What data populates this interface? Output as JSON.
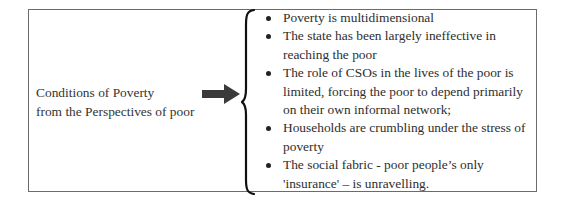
{
  "diagram": {
    "left_label": {
      "line1": "Conditions of Poverty",
      "line2": "from the Perspectives of poor"
    },
    "connector": {
      "arrow_icon": "right-arrow-icon",
      "brace_icon": "left-curly-brace-icon"
    },
    "bullets": [
      {
        "text": "Poverty is multidimensional"
      },
      {
        "text": "The state has been largely ineffective in reaching the poor"
      },
      {
        "text": "The role of CSOs in the lives of the poor is limited, forcing the poor to depend primarily on their own informal network;"
      },
      {
        "text": "Households are crumbling under the stress of poverty"
      },
      {
        "text": "The social fabric - poor people’s only 'insurance' – is unravelling."
      }
    ],
    "colors": {
      "border": "#6b6b6b",
      "text": "#2e2e2e",
      "arrow": "#3a3a3a"
    }
  }
}
